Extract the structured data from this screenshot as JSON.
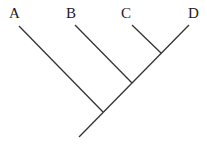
{
  "diagram": {
    "type": "cladogram",
    "line_color": "#333333",
    "text_color": "#1a1a1a",
    "taxa": [
      {
        "id": "A",
        "label": "A",
        "label_x": 9,
        "label_y": 6,
        "tip": [
          19,
          26
        ],
        "node": [
          103,
          112
        ]
      },
      {
        "id": "B",
        "label": "B",
        "label_x": 66,
        "label_y": 6,
        "tip": [
          75,
          25
        ],
        "node": [
          132,
          83
        ]
      },
      {
        "id": "C",
        "label": "C",
        "label_x": 121,
        "label_y": 6,
        "tip": [
          132,
          25
        ],
        "node": [
          161,
          53
        ]
      },
      {
        "id": "D",
        "label": "D",
        "label_x": 188,
        "label_y": 6,
        "tip": [
          189,
          25
        ],
        "node": [
          161,
          53
        ]
      }
    ],
    "trunk": {
      "root": [
        79,
        137
      ],
      "top": [
        189,
        25
      ]
    },
    "groupings": [
      "(A,(B,(C,D)))"
    ]
  }
}
